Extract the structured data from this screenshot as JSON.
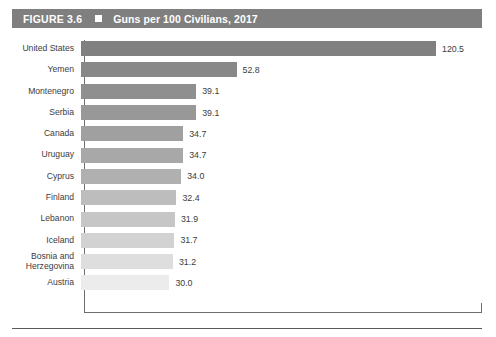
{
  "figure": {
    "number_label": "FIGURE 3.6",
    "separator_icon": "square-bullet-icon",
    "title": "Guns per 100 Civilians, 2017"
  },
  "chart_data": {
    "type": "bar",
    "orientation": "horizontal",
    "title": "Guns per 100 Civilians, 2017",
    "xlabel": "",
    "ylabel": "",
    "xlim": [
      0,
      120.5
    ],
    "grid": false,
    "legend": "none",
    "value_labels": true,
    "categories": [
      "United States",
      "Yemen",
      "Montenegro",
      "Serbia",
      "Canada",
      "Uruguay",
      "Cyprus",
      "Finland",
      "Lebanon",
      "Iceland",
      "Bosnia and\nHerzegovina",
      "Austria"
    ],
    "values": [
      120.5,
      52.8,
      39.1,
      39.1,
      34.7,
      34.7,
      34.0,
      32.4,
      31.9,
      31.7,
      31.2,
      30.0
    ],
    "value_text": [
      "120.5",
      "52.8",
      "39.1",
      "39.1",
      "34.7",
      "34.7",
      "34.0",
      "32.4",
      "31.9",
      "31.7",
      "31.2",
      "30.0"
    ],
    "bar_colors": [
      "#808080",
      "#888888",
      "#8f8f8f",
      "#989898",
      "#a0a0a0",
      "#a8a8a8",
      "#b0b0b0",
      "#bdbdbd",
      "#c6c6c6",
      "#d2d2d2",
      "#dedede",
      "#ececec"
    ]
  },
  "colors": {
    "banner_background": "#7f7f7f",
    "banner_text": "#ffffff",
    "axis": "#6e6e6e",
    "label_text": "#3c3c3c",
    "rule": "#5a5a5a"
  }
}
